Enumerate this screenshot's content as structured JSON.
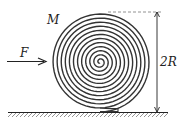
{
  "diagram": {
    "labels": {
      "mass": "M",
      "force": "F",
      "height": "2R"
    },
    "colors": {
      "ink": "#222222",
      "hatch": "#555555",
      "dashed": "#777777"
    },
    "roll": {
      "cx": 100,
      "cy": 62,
      "outer_radius": 50,
      "turns": 12
    },
    "ground": {
      "y": 112,
      "x_start": 8,
      "x_end": 168
    }
  }
}
